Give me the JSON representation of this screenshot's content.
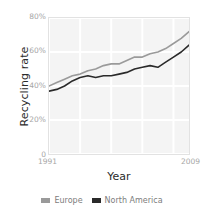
{
  "chart_data": {
    "type": "line",
    "title": "",
    "xlabel": "Year",
    "ylabel": "Recycling rate",
    "xlim": [
      1991,
      2009
    ],
    "ylim": [
      0,
      80
    ],
    "grid": true,
    "legend_position": "bottom",
    "x": [
      1991,
      1992,
      1993,
      1994,
      1995,
      1996,
      1997,
      1998,
      1999,
      2000,
      2001,
      2002,
      2003,
      2004,
      2005,
      2006,
      2007,
      2008,
      2009
    ],
    "y_ticks": [
      0,
      20,
      40,
      60,
      80
    ],
    "y_tick_labels": [
      "0",
      "20%",
      "40%",
      "60%",
      "80%"
    ],
    "x_ticks": [
      1991,
      2009
    ],
    "x_tick_labels": [
      "1991",
      "2009"
    ],
    "series": [
      {
        "name": "Europe",
        "color": "#9a9a9a",
        "values": [
          40,
          42,
          44,
          46,
          47,
          49,
          50,
          52,
          53,
          53,
          55,
          57,
          57,
          59,
          60,
          62,
          65,
          68,
          72
        ]
      },
      {
        "name": "North America",
        "color": "#2a2a2a",
        "values": [
          37,
          38,
          40,
          43,
          45,
          46,
          45,
          46,
          46,
          47,
          48,
          50,
          51,
          52,
          51,
          54,
          57,
          60,
          64
        ]
      }
    ]
  },
  "axes": {
    "y_title": "Recycling rate",
    "x_title": "Year",
    "y_tick_labels": [
      "80%",
      "60%",
      "40%",
      "20%",
      "0"
    ],
    "x_tick_left": "1991",
    "x_tick_right": "2009"
  },
  "legend": {
    "items": [
      {
        "label": "Europe",
        "color": "#9a9a9a"
      },
      {
        "label": "North America",
        "color": "#2a2a2a"
      }
    ]
  },
  "colors": {
    "europe": "#9a9a9a",
    "north_america": "#2a2a2a",
    "plot_background": "#f4f4f4",
    "gridline": "#ffffff",
    "tick_text": "#a6a6a6",
    "axis_title_text": "#2b2b2b"
  }
}
